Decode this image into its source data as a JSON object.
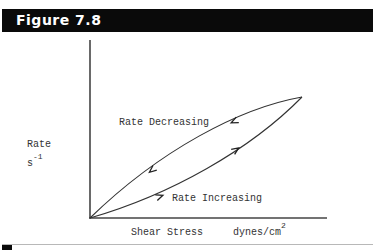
{
  "header": {
    "title": "Figure 7.8"
  },
  "figure": {
    "y_axis": {
      "label": "Rate",
      "unit_base": "s",
      "unit_exp": "-1"
    },
    "x_axis": {
      "label": "Shear Stress",
      "unit_base": "dynes/cm",
      "unit_exp": "2"
    },
    "curves": [
      {
        "label": "Rate Decreasing",
        "direction": "toward origin"
      },
      {
        "label": "Rate Increasing",
        "direction": "away from origin"
      }
    ]
  },
  "colors": {
    "header_bg": "#0a0a0a",
    "header_text": "#ffffff",
    "line": "#333333"
  }
}
